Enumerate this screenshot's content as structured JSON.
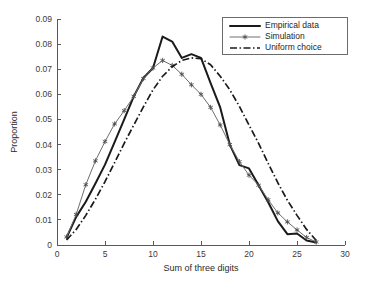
{
  "chart_data": {
    "type": "line",
    "title": "",
    "xlabel": "Sum of three digits",
    "ylabel": "Proportion",
    "xlim": [
      0,
      30
    ],
    "ylim": [
      0,
      0.09
    ],
    "xticks": [
      "0",
      "5",
      "10",
      "15",
      "20",
      "25",
      "30"
    ],
    "xtick_values": [
      0,
      5,
      10,
      15,
      20,
      25,
      30
    ],
    "yticks": [
      "0",
      "0.01",
      "0.02",
      "0.03",
      "0.04",
      "0.05",
      "0.06",
      "0.07",
      "0.08",
      "0.09"
    ],
    "ytick_values": [
      0,
      0.01,
      0.02,
      0.03,
      0.04,
      0.05,
      0.06,
      0.07,
      0.08,
      0.09
    ],
    "grid": false,
    "legend_position": "top-right",
    "x": [
      1,
      2,
      3,
      4,
      5,
      6,
      7,
      8,
      9,
      10,
      11,
      12,
      13,
      14,
      15,
      16,
      17,
      18,
      19,
      20,
      21,
      22,
      23,
      24,
      25,
      26,
      27
    ],
    "series": [
      {
        "name": "Empirical data",
        "style": "solid",
        "color": "#1a1a1a",
        "linewidth": 2,
        "marker": "none",
        "values": [
          0.003,
          0.0112,
          0.0172,
          0.0245,
          0.032,
          0.041,
          0.05,
          0.0592,
          0.0665,
          0.0705,
          0.083,
          0.081,
          0.0745,
          0.076,
          0.0745,
          0.0645,
          0.0548,
          0.04,
          0.0318,
          0.0305,
          0.0238,
          0.017,
          0.0095,
          0.0043,
          0.0046,
          0.0018,
          0.001
        ]
      },
      {
        "name": "Simulation",
        "style": "solid-marker",
        "color": "#6e6e6e",
        "linewidth": 1,
        "marker": "asterisk",
        "values": [
          0.0032,
          0.0122,
          0.024,
          0.0335,
          0.0412,
          0.0482,
          0.0535,
          0.0592,
          0.0663,
          0.0705,
          0.0735,
          0.0715,
          0.068,
          0.0638,
          0.06,
          0.0548,
          0.0478,
          0.04,
          0.0332,
          0.0278,
          0.0238,
          0.018,
          0.0128,
          0.0092,
          0.006,
          0.003,
          0.0012
        ]
      },
      {
        "name": "Uniform choice",
        "style": "dash-dot",
        "color": "#1a1a1a",
        "linewidth": 1.7,
        "marker": "none",
        "values": [
          0.002,
          0.0062,
          0.0118,
          0.0182,
          0.0252,
          0.0328,
          0.0405,
          0.0478,
          0.055,
          0.0618,
          0.0672,
          0.071,
          0.0735,
          0.0745,
          0.0742,
          0.0718,
          0.0672,
          0.0618,
          0.0552,
          0.0478,
          0.0405,
          0.0325,
          0.0248,
          0.0178,
          0.0118,
          0.0062,
          0.0018
        ]
      }
    ]
  },
  "legend": {
    "items": [
      {
        "label": "Empirical data",
        "key": "empirical"
      },
      {
        "label": "Simulation",
        "key": "simulation"
      },
      {
        "label": "Uniform choice",
        "key": "uniform"
      }
    ]
  }
}
